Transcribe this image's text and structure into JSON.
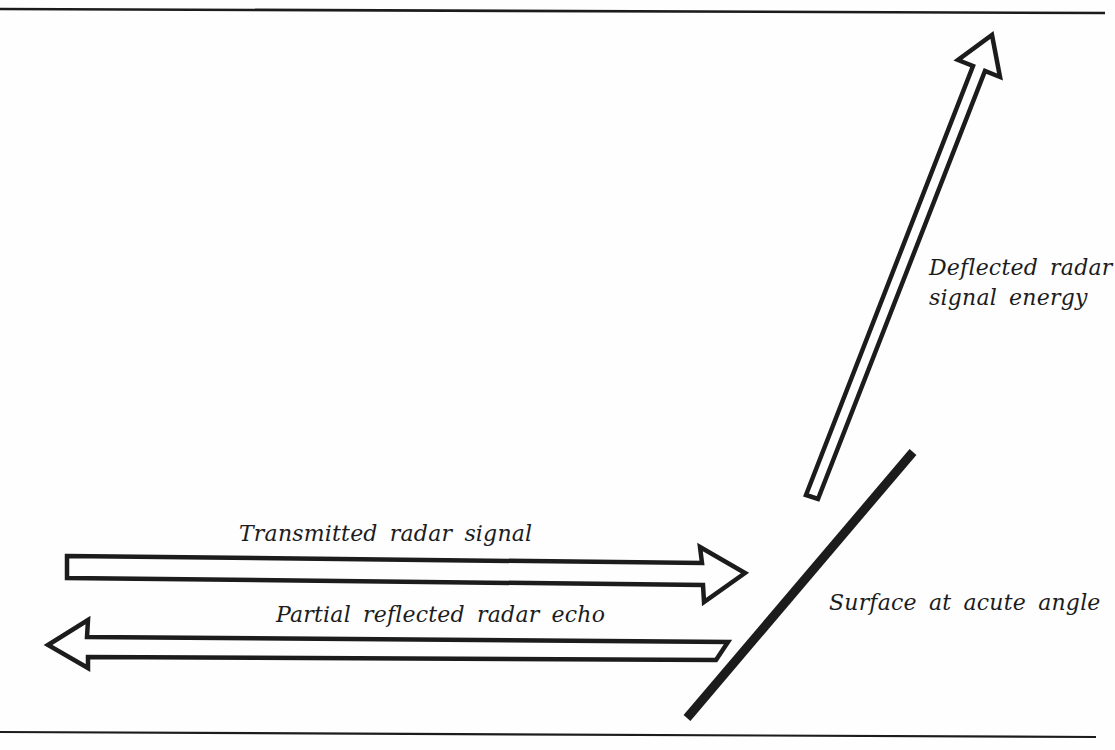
{
  "labels": {
    "transmitted_arrow": "Transmitted radar signal",
    "reflected_arrow": "Partial reflected radar echo",
    "deflected_arrow_line1": "Deflected radar",
    "deflected_arrow_line2": "signal energy",
    "surface": "Surface at acute angle"
  },
  "colors": {
    "ink": "#1c1c1c",
    "paper": "#fefefe"
  }
}
